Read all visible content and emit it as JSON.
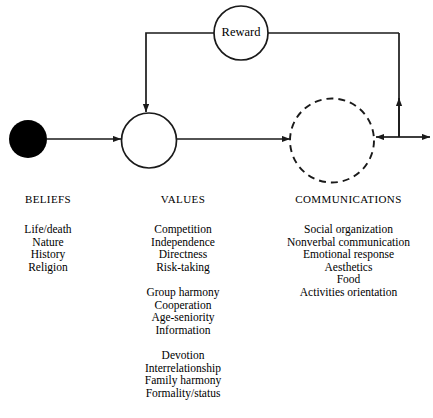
{
  "diagram": {
    "nodes": {
      "beliefs_node": {
        "name": "beliefs-node",
        "style": "filled-circle"
      },
      "values_node": {
        "name": "values-node",
        "style": "solid-circle"
      },
      "communications_node": {
        "name": "communications-node",
        "style": "dashed-circle"
      },
      "reward_node": {
        "label": "Reward",
        "style": "solid-circle"
      }
    },
    "colors": {
      "stroke": "#1a1a1a",
      "fill_node": "#000000",
      "background": "#ffffff"
    }
  },
  "columns": [
    {
      "key": "beliefs",
      "heading": "BELIEFS",
      "groups": [
        [
          "Life/death",
          "Nature",
          "History",
          "Religion"
        ]
      ]
    },
    {
      "key": "values",
      "heading": "VALUES",
      "groups": [
        [
          "Competition",
          "Independence",
          "Directness",
          "Risk-taking"
        ],
        [
          "Group harmony",
          "Cooperation",
          "Age-seniority",
          "Information"
        ],
        [
          "Devotion",
          "Interrelationship",
          "Family harmony",
          "Formality/status"
        ]
      ]
    },
    {
      "key": "communications",
      "heading": "COMMUNICATIONS",
      "groups": [
        [
          "Social organization",
          "Nonverbal communication",
          "Emotional response",
          "Aesthetics",
          "Food",
          "Activities orientation"
        ]
      ]
    }
  ]
}
